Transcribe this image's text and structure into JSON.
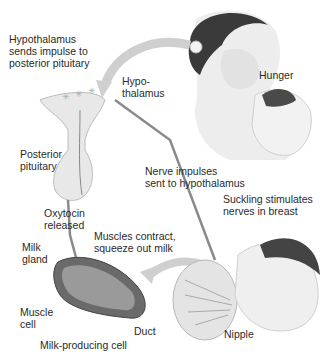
{
  "diagram": {
    "labels": {
      "hypothalamus_sends": "Hypothalamus\nsends impulse to\nposterior pituitary",
      "hypothalamus": "Hypo-\nthalamus",
      "hunger": "Hunger",
      "posterior_pituitary": "Posterior\npituitary",
      "nerve_impulses": "Nerve impulses\nsent to hypothalamus",
      "suckling": "Suckling stimulates\nnerves in breast",
      "oxytocin": "Oxytocin\nreleased",
      "muscles_contract": "Muscles contract,\nsqueeze out milk",
      "milk_gland": "Milk\ngland",
      "muscle_cell": "Muscle\ncell",
      "duct": "Duct",
      "milk_producing_cell": "Milk-producing cell",
      "nipple": "Nipple"
    },
    "colors": {
      "arrow": "#c8c8c8",
      "nerve_line": "#7a7a7a",
      "skin": "#e6e6e6",
      "hair": "#3a3a3a"
    }
  }
}
